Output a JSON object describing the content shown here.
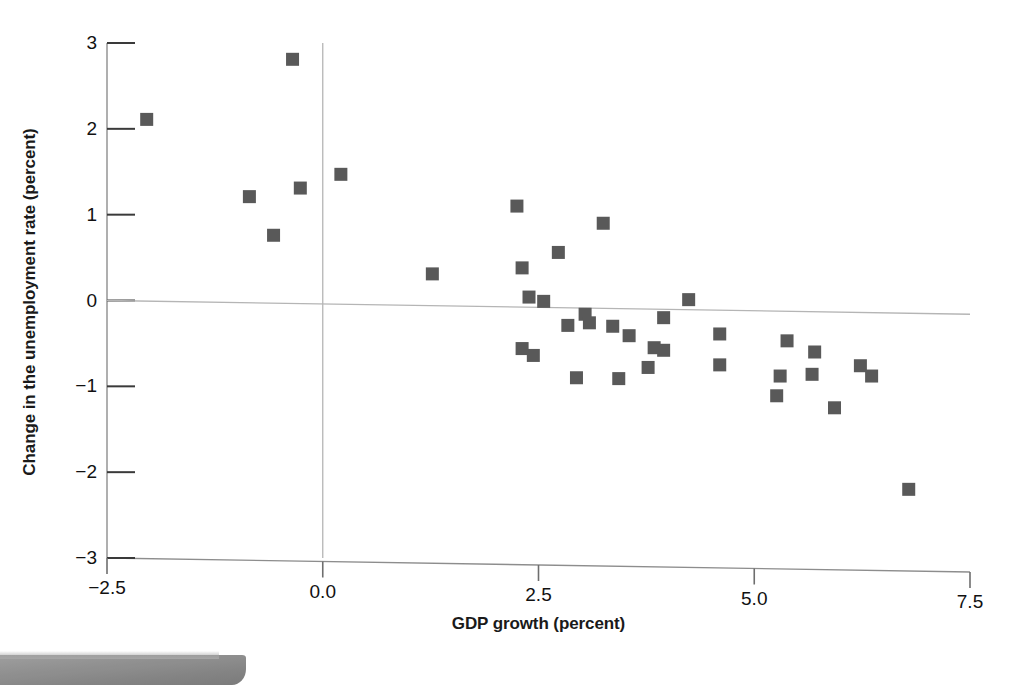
{
  "chart_data": {
    "type": "scatter",
    "title": "",
    "subtitle": "",
    "xlabel": "GDP growth (percent)",
    "ylabel": "Change in the unemployment rate (percent)",
    "xlim": [
      -2.5,
      7.5
    ],
    "ylim": [
      -3,
      3
    ],
    "xticks": [
      "-2.5",
      "0.0",
      "2.5",
      "5.0",
      "7.5"
    ],
    "xtick_values": [
      -2.5,
      0.0,
      2.5,
      5.0,
      7.5
    ],
    "yticks": [
      "3",
      "2",
      "1",
      "0",
      "-1",
      "-2",
      "-3"
    ],
    "ytick_values": [
      3,
      2,
      1,
      0,
      -1,
      -2,
      -3
    ],
    "grid": false,
    "legend": null,
    "marker": {
      "shape": "square",
      "color": "#595959",
      "size_px": 13
    },
    "reference_lines": [
      {
        "name": "vertical-zero-line",
        "orientation": "vertical",
        "x": 0.0,
        "color": "#b5b5b5"
      },
      {
        "name": "fitted-regression-line",
        "orientation": "sloped",
        "x_start": -2.5,
        "y_start": 0.0,
        "x_end": 7.5,
        "y_end": -0.16,
        "color": "#b5b5b5"
      }
    ],
    "points": [
      {
        "x": -2.04,
        "y": 2.11
      },
      {
        "x": -0.35,
        "y": 2.81
      },
      {
        "x": -0.85,
        "y": 1.21
      },
      {
        "x": -0.26,
        "y": 1.31
      },
      {
        "x": -0.57,
        "y": 0.76
      },
      {
        "x": 0.21,
        "y": 1.47
      },
      {
        "x": 1.27,
        "y": 0.31
      },
      {
        "x": 2.25,
        "y": 1.1
      },
      {
        "x": 2.31,
        "y": 0.38
      },
      {
        "x": 2.39,
        "y": 0.04
      },
      {
        "x": 2.56,
        "y": -0.01
      },
      {
        "x": 2.73,
        "y": 0.56
      },
      {
        "x": 3.25,
        "y": 0.9
      },
      {
        "x": 2.31,
        "y": -0.56
      },
      {
        "x": 2.44,
        "y": -0.64
      },
      {
        "x": 2.84,
        "y": -0.29
      },
      {
        "x": 3.04,
        "y": -0.16
      },
      {
        "x": 3.09,
        "y": -0.26
      },
      {
        "x": 3.36,
        "y": -0.3
      },
      {
        "x": 3.55,
        "y": -0.41
      },
      {
        "x": 3.84,
        "y": -0.55
      },
      {
        "x": 3.95,
        "y": -0.58
      },
      {
        "x": 3.95,
        "y": -0.2
      },
      {
        "x": 4.24,
        "y": 0.01
      },
      {
        "x": 3.77,
        "y": -0.78
      },
      {
        "x": 2.94,
        "y": -0.9
      },
      {
        "x": 3.43,
        "y": -0.91
      },
      {
        "x": 4.6,
        "y": -0.39
      },
      {
        "x": 4.6,
        "y": -0.75
      },
      {
        "x": 5.26,
        "y": -1.11
      },
      {
        "x": 5.3,
        "y": -0.88
      },
      {
        "x": 5.38,
        "y": -0.47
      },
      {
        "x": 5.67,
        "y": -0.86
      },
      {
        "x": 5.7,
        "y": -0.6
      },
      {
        "x": 5.93,
        "y": -1.25
      },
      {
        "x": 6.23,
        "y": -0.76
      },
      {
        "x": 6.36,
        "y": -0.88
      },
      {
        "x": 6.79,
        "y": -2.2
      }
    ]
  }
}
